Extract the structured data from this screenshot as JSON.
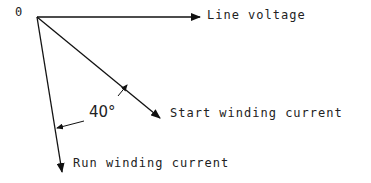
{
  "diagram": {
    "origin_label": "0",
    "vectors": [
      {
        "name": "line-voltage",
        "label": "Line voltage"
      },
      {
        "name": "start-winding-current",
        "label": "Start winding current"
      },
      {
        "name": "run-winding-current",
        "label": "Run winding current"
      }
    ],
    "angle_label": "40°",
    "line_color": "#111111"
  }
}
